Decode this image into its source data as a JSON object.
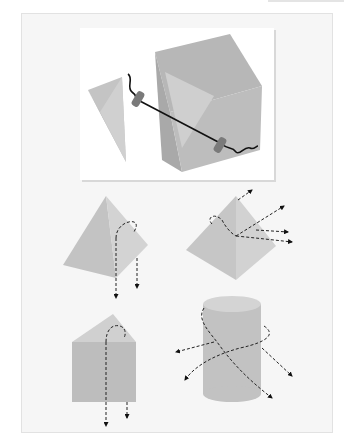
{
  "figure": {
    "panels": [
      {
        "id": "fiber-coupling",
        "description": "Fiber segments with connectors linking a prism wedge and a cube"
      },
      {
        "id": "pyramid-down",
        "description": "Pyramid with dashed light paths exiting downward"
      },
      {
        "id": "pyramid-scatter",
        "description": "Pyramid with dashed light paths scattering outward"
      },
      {
        "id": "prism-down",
        "description": "Triangular prism with dashed light paths exiting downward"
      },
      {
        "id": "cylinder-spiral",
        "description": "Cylinder with dashed helical light paths exiting sideways"
      }
    ],
    "colors": {
      "shape_light": "#c9c9c9",
      "shape_mid": "#b9b9b9",
      "shape_dark": "#aaaaaa",
      "line": "#111111",
      "connector": "#777777"
    }
  }
}
